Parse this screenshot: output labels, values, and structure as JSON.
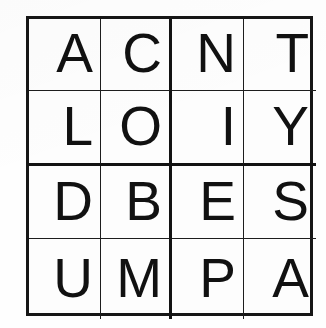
{
  "document": {
    "kind": "letter-grid-puzzle",
    "rows": 4,
    "columns": 4,
    "ink_color": "#111111",
    "background_color": "#fdfdfd",
    "border_color": "#161616"
  },
  "grid": {
    "cells": [
      {
        "row": 1,
        "col": 1,
        "letter": "A"
      },
      {
        "row": 1,
        "col": 2,
        "letter": "C"
      },
      {
        "row": 1,
        "col": 3,
        "letter": "N"
      },
      {
        "row": 1,
        "col": 4,
        "letter": "T"
      },
      {
        "row": 2,
        "col": 1,
        "letter": "L"
      },
      {
        "row": 2,
        "col": 2,
        "letter": "O"
      },
      {
        "row": 2,
        "col": 3,
        "letter": "I"
      },
      {
        "row": 2,
        "col": 4,
        "letter": "Y"
      },
      {
        "row": 3,
        "col": 1,
        "letter": "D"
      },
      {
        "row": 3,
        "col": 2,
        "letter": "B"
      },
      {
        "row": 3,
        "col": 3,
        "letter": "E"
      },
      {
        "row": 3,
        "col": 4,
        "letter": "S"
      },
      {
        "row": 4,
        "col": 1,
        "letter": "U"
      },
      {
        "row": 4,
        "col": 2,
        "letter": "M"
      },
      {
        "row": 4,
        "col": 3,
        "letter": "P"
      },
      {
        "row": 4,
        "col": 4,
        "letter": "A"
      }
    ],
    "rows_text": [
      "ACNT",
      "LOIY",
      "DBES",
      "UMPA"
    ],
    "columns_text": [
      "ALDU",
      "COBM",
      "NIEP",
      "TYSA"
    ]
  }
}
